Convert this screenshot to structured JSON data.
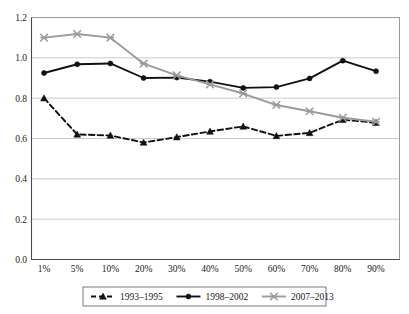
{
  "chart_data": {
    "type": "line",
    "title": "",
    "subtitle": "",
    "xlabel": "",
    "ylabel": "",
    "categories": [
      "1%",
      "5%",
      "10%",
      "20%",
      "30%",
      "40%",
      "50%",
      "60%",
      "70%",
      "80%",
      "90%"
    ],
    "ylim": [
      0.0,
      1.2
    ],
    "ytick_labels": [
      "0.0",
      "0.2",
      "0.4",
      "0.6",
      "0.8",
      "1.0",
      "1.2"
    ],
    "ytick_values": [
      0.0,
      0.2,
      0.4,
      0.6,
      0.8,
      1.0,
      1.2
    ],
    "grid": true,
    "legend_position": "bottom",
    "series": [
      {
        "name": "1993–1995",
        "color": "#111111",
        "line_style": "dashed",
        "marker": "triangle",
        "values": [
          0.8,
          0.62,
          0.615,
          0.58,
          0.607,
          0.635,
          0.66,
          0.613,
          0.628,
          0.693,
          0.678
        ]
      },
      {
        "name": "1998–2002",
        "color": "#111111",
        "line_style": "solid",
        "marker": "circle",
        "values": [
          0.925,
          0.968,
          0.972,
          0.9,
          0.902,
          0.882,
          0.851,
          0.855,
          0.898,
          0.986,
          0.934
        ]
      },
      {
        "name": "2007–2013",
        "color": "#9b9b9b",
        "line_style": "solid",
        "marker": "x",
        "values": [
          1.1,
          1.118,
          1.1,
          0.971,
          0.913,
          0.868,
          0.823,
          0.766,
          0.735,
          0.703,
          0.683
        ]
      }
    ]
  }
}
